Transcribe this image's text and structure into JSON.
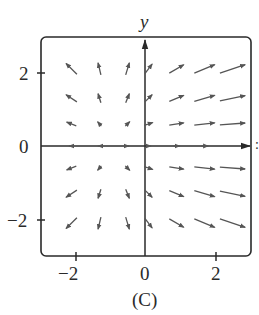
{
  "chart_data": {
    "type": "vector_field",
    "title": "",
    "caption": "(C)",
    "xlabel": "x",
    "ylabel": "y",
    "xlim": [
      -2.8,
      3.0
    ],
    "ylim": [
      -3.0,
      3.0
    ],
    "xticks": [
      -2,
      0,
      2
    ],
    "yticks": [
      -2,
      0,
      2
    ],
    "xtick_labels": [
      "−2",
      "0",
      "2"
    ],
    "ytick_labels": [
      "−2",
      "0",
      "2"
    ],
    "grid": false,
    "axes_through_origin": true,
    "frame": "rounded-box",
    "sample_x": [
      -2.1,
      -1.3,
      -0.5,
      0.1,
      0.9,
      1.7,
      2.5
    ],
    "sample_y": [
      2.1,
      1.3,
      0.6,
      0.0,
      -0.6,
      -1.3,
      -2.1
    ],
    "vectors": [
      {
        "x": -2.1,
        "y": 2.1,
        "dx": -0.45,
        "dy": 0.45
      },
      {
        "x": -1.3,
        "y": 2.1,
        "dx": -0.12,
        "dy": 0.5
      },
      {
        "x": -0.5,
        "y": 2.1,
        "dx": 0.15,
        "dy": 0.5
      },
      {
        "x": 0.1,
        "y": 2.1,
        "dx": 0.3,
        "dy": 0.4
      },
      {
        "x": 0.9,
        "y": 2.1,
        "dx": 0.6,
        "dy": 0.35
      },
      {
        "x": 1.7,
        "y": 2.1,
        "dx": 0.85,
        "dy": 0.35
      },
      {
        "x": 2.5,
        "y": 2.1,
        "dx": 1.05,
        "dy": 0.35
      },
      {
        "x": -2.1,
        "y": 1.3,
        "dx": -0.45,
        "dy": 0.3
      },
      {
        "x": -1.3,
        "y": 1.3,
        "dx": -0.12,
        "dy": 0.38
      },
      {
        "x": -0.5,
        "y": 1.3,
        "dx": 0.15,
        "dy": 0.38
      },
      {
        "x": 0.1,
        "y": 1.3,
        "dx": 0.3,
        "dy": 0.3
      },
      {
        "x": 0.9,
        "y": 1.3,
        "dx": 0.6,
        "dy": 0.25
      },
      {
        "x": 1.7,
        "y": 1.3,
        "dx": 0.85,
        "dy": 0.25
      },
      {
        "x": 2.5,
        "y": 1.3,
        "dx": 1.05,
        "dy": 0.22
      },
      {
        "x": -2.1,
        "y": 0.6,
        "dx": -0.4,
        "dy": 0.15
      },
      {
        "x": -1.3,
        "y": 0.6,
        "dx": -0.15,
        "dy": 0.18
      },
      {
        "x": -0.5,
        "y": 0.6,
        "dx": 0.18,
        "dy": 0.18
      },
      {
        "x": 0.1,
        "y": 0.6,
        "dx": 0.35,
        "dy": 0.12
      },
      {
        "x": 0.9,
        "y": 0.6,
        "dx": 0.6,
        "dy": 0.1
      },
      {
        "x": 1.7,
        "y": 0.6,
        "dx": 0.85,
        "dy": 0.1
      },
      {
        "x": 2.5,
        "y": 0.6,
        "dx": 1.05,
        "dy": 0.08
      },
      {
        "x": -2.1,
        "y": 0.0,
        "dx": -0.2,
        "dy": 0.0
      },
      {
        "x": -1.3,
        "y": 0.0,
        "dx": -0.1,
        "dy": 0.0
      },
      {
        "x": -0.5,
        "y": 0.0,
        "dx": 0.12,
        "dy": 0.0
      },
      {
        "x": 0.1,
        "y": 0.0,
        "dx": 0.2,
        "dy": 0.0
      },
      {
        "x": 0.9,
        "y": 0.0,
        "dx": 0.25,
        "dy": 0.0
      },
      {
        "x": 1.7,
        "y": 0.0,
        "dx": 0.3,
        "dy": 0.0
      },
      {
        "x": -2.1,
        "y": -0.6,
        "dx": -0.4,
        "dy": -0.15
      },
      {
        "x": -1.3,
        "y": -0.6,
        "dx": -0.15,
        "dy": -0.18
      },
      {
        "x": -0.5,
        "y": -0.6,
        "dx": 0.18,
        "dy": -0.18
      },
      {
        "x": 0.1,
        "y": -0.6,
        "dx": 0.35,
        "dy": -0.12
      },
      {
        "x": 0.9,
        "y": -0.6,
        "dx": 0.6,
        "dy": -0.1
      },
      {
        "x": 1.7,
        "y": -0.6,
        "dx": 0.85,
        "dy": -0.1
      },
      {
        "x": 2.5,
        "y": -0.6,
        "dx": 1.05,
        "dy": -0.08
      },
      {
        "x": -2.1,
        "y": -1.3,
        "dx": -0.45,
        "dy": -0.3
      },
      {
        "x": -1.3,
        "y": -1.3,
        "dx": -0.12,
        "dy": -0.38
      },
      {
        "x": -0.5,
        "y": -1.3,
        "dx": 0.15,
        "dy": -0.38
      },
      {
        "x": 0.1,
        "y": -1.3,
        "dx": 0.3,
        "dy": -0.3
      },
      {
        "x": 0.9,
        "y": -1.3,
        "dx": 0.6,
        "dy": -0.25
      },
      {
        "x": 1.7,
        "y": -1.3,
        "dx": 0.85,
        "dy": -0.25
      },
      {
        "x": 2.5,
        "y": -1.3,
        "dx": 1.05,
        "dy": -0.22
      },
      {
        "x": -2.1,
        "y": -2.1,
        "dx": -0.45,
        "dy": -0.45
      },
      {
        "x": -1.3,
        "y": -2.1,
        "dx": -0.12,
        "dy": -0.5
      },
      {
        "x": -0.5,
        "y": -2.1,
        "dx": 0.15,
        "dy": -0.5
      },
      {
        "x": 0.1,
        "y": -2.1,
        "dx": 0.3,
        "dy": -0.4
      },
      {
        "x": 0.9,
        "y": -2.1,
        "dx": 0.6,
        "dy": -0.35
      },
      {
        "x": 1.7,
        "y": -2.1,
        "dx": 0.85,
        "dy": -0.35
      },
      {
        "x": 2.5,
        "y": -2.1,
        "dx": 1.05,
        "dy": -0.35
      }
    ],
    "colors": {
      "axis": "#2a2a2a",
      "arrow": "#555555",
      "frame": "#2a2a2a",
      "background": "#ffffff"
    }
  },
  "labels": {
    "y_axis": "y",
    "x_axis_partial": ":",
    "ytick_2": "2",
    "ytick_0": "0",
    "ytick_m2": "−2",
    "xtick_m2": "−2",
    "xtick_0": "0",
    "xtick_2": "2",
    "caption": "(C)"
  }
}
